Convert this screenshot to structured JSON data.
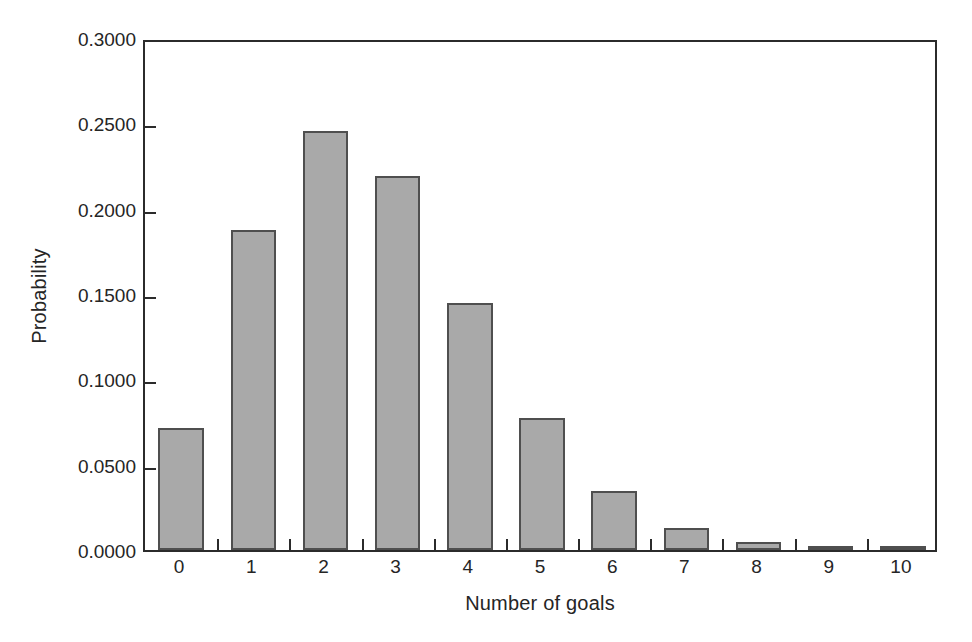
{
  "chart_data": {
    "type": "bar",
    "title": "",
    "xlabel": "Number of goals",
    "ylabel": "Probability",
    "categories": [
      "0",
      "1",
      "2",
      "3",
      "4",
      "5",
      "6",
      "7",
      "8",
      "9",
      "10"
    ],
    "values": [
      0.0715,
      0.1875,
      0.2455,
      0.219,
      0.1447,
      0.0773,
      0.0347,
      0.0131,
      0.0046,
      0.0014,
      0.0004
    ],
    "ylim": [
      0.0,
      0.3
    ],
    "xlim": [
      -0.5,
      10.5
    ],
    "ytick_labels": [
      "0.0000",
      "0.0500",
      "0.1000",
      "0.1500",
      "0.2000",
      "0.2500",
      "0.3000"
    ],
    "ytick_values": [
      0.0,
      0.05,
      0.1,
      0.15,
      0.2,
      0.25,
      0.3
    ],
    "grid": false,
    "legend": null,
    "bar_color": "#a9a9a9",
    "bar_edge_color": "#4f4f4f",
    "axis_color": "#2b2b2b"
  }
}
